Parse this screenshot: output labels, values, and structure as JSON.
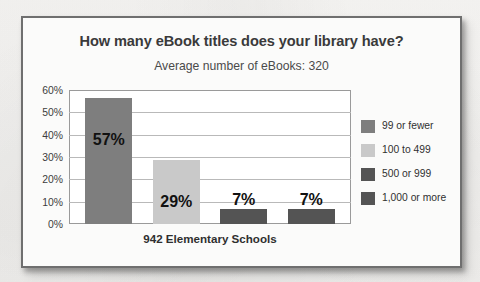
{
  "chart_data": {
    "type": "bar",
    "title": "How many eBook titles does your library have?",
    "subtitle": "Average number of eBooks: 320",
    "xlabel": "942 Elementary Schools",
    "ylabel": "",
    "ylim": [
      0,
      60
    ],
    "grid": true,
    "legend_position": "right",
    "categories": [
      "99 or fewer",
      "100 to 499",
      "500 or 999",
      "1,000 or more"
    ],
    "values": [
      57,
      29,
      7,
      7
    ],
    "value_labels": [
      "57%",
      "29%",
      "7%",
      "7%"
    ],
    "ytick_labels": [
      "60%",
      "50%",
      "40%",
      "30%",
      "20%",
      "10%",
      "0%"
    ],
    "ytick_values": [
      60,
      50,
      40,
      30,
      20,
      10,
      0
    ],
    "bar_colors": [
      "#7e7e7e",
      "#c9c9c9",
      "#545454",
      "#545454"
    ],
    "legend": [
      {
        "label": "99 or fewer",
        "color": "#7e7e7e"
      },
      {
        "label": "100 to 499",
        "color": "#c9c9c9"
      },
      {
        "label": "500 or 999",
        "color": "#545454"
      },
      {
        "label": "1,000 or more",
        "color": "#545454"
      }
    ]
  },
  "colors": {
    "page_background": "#f6f5f3",
    "card_background": "#fbfbfa",
    "card_border": "#6f6f6f",
    "plot_border": "#9a9a9a",
    "gridline": "#b9b9b9",
    "title_text": "#3a3a3a",
    "body_text": "#303030"
  }
}
